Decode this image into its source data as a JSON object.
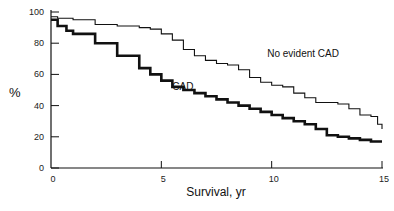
{
  "chart_data": {
    "type": "line",
    "title": "",
    "xlabel": "Survival, yr",
    "ylabel": "%",
    "xlim": [
      0,
      15
    ],
    "ylim": [
      0,
      100
    ],
    "x_ticks": [
      "0",
      "5",
      "10",
      "15"
    ],
    "y_ticks": [
      "0",
      "20",
      "40",
      "60",
      "80",
      "100"
    ],
    "grid": false,
    "legend": "inline annotations",
    "series": [
      {
        "name": "No evident CAD",
        "style": "thin step line",
        "x": [
          0,
          0.3,
          1,
          2,
          3,
          4,
          4.5,
          5,
          5.5,
          6,
          6.5,
          7,
          7.5,
          8,
          8.5,
          9,
          9.5,
          10,
          10.5,
          11,
          11.5,
          12,
          12.5,
          13,
          13.5,
          14,
          14.5,
          14.8,
          15
        ],
        "values": [
          97,
          96,
          95,
          92,
          91,
          90,
          89,
          86,
          82,
          76,
          72,
          69,
          67,
          66,
          63,
          58,
          55,
          53,
          52,
          48,
          45,
          42,
          42,
          41,
          38,
          34,
          33,
          28,
          25
        ]
      },
      {
        "name": "CAD",
        "style": "thick step line",
        "x": [
          0,
          0.3,
          0.7,
          1,
          2,
          3,
          4,
          4.5,
          5,
          5.5,
          6,
          6.5,
          7,
          7.5,
          8,
          8.5,
          9,
          9.5,
          10,
          10.5,
          11,
          11.5,
          12,
          12.5,
          13,
          13.5,
          14,
          14.5,
          15
        ],
        "values": [
          95,
          91,
          88,
          86,
          80,
          72,
          64,
          60,
          56,
          52,
          50,
          48,
          46,
          44,
          42,
          40,
          38,
          36,
          34,
          32,
          30,
          28,
          25,
          21,
          20,
          19,
          18,
          17,
          17
        ]
      }
    ],
    "annotations": [
      {
        "text": "No evident CAD",
        "x": 9.8,
        "y": 71
      },
      {
        "text": "CAD",
        "x": 5.5,
        "y": 50
      }
    ]
  }
}
